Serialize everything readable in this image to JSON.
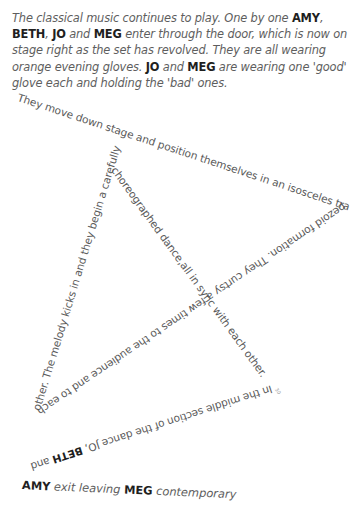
{
  "intro": {
    "parts": [
      {
        "text": "The classical music continues to play. One by one ",
        "bold": false
      },
      {
        "text": "AMY",
        "bold": true
      },
      {
        "text": ", ",
        "bold": false
      },
      {
        "text": "BETH",
        "bold": true
      },
      {
        "text": ", ",
        "bold": false
      },
      {
        "text": "JO",
        "bold": true
      },
      {
        "text": " and ",
        "bold": false
      },
      {
        "text": "MEG",
        "bold": true
      },
      {
        "text": " enter through the door, which is now on stage right as the set has revolved. They are all wearing orange evening gloves. ",
        "bold": false
      },
      {
        "text": "JO",
        "bold": true
      },
      {
        "text": " and ",
        "bold": false
      },
      {
        "text": "MEG",
        "bold": true
      },
      {
        "text": " are wearing one 'good' glove each and holding the 'bad' ones.",
        "bold": false
      }
    ]
  },
  "shaped_text": {
    "segment_1": "They move down stage and position themselves in an isosceles tra",
    "segment_2": "pezoid formation. They curtsy a few times to the audience and to each",
    "segment_3": "other. The melody kicks in and they begin a carefully",
    "segment_4": "choreographed dance,all in sync with each other.",
    "segment_5_prefix": "In the middle section of the dance JO, ",
    "segment_5_bold": "BETH",
    "segment_5_suffix": " and",
    "page_mark": "30"
  },
  "closing": {
    "amy": "AMY",
    "middle": " exit leaving ",
    "meg": "MEG",
    "end": " contemporary"
  }
}
